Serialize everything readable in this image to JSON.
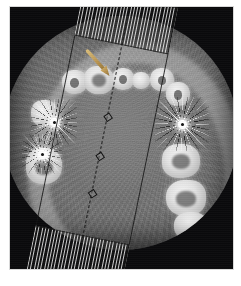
{
  "image": {
    "modality": "CBCT",
    "view": "axial",
    "anatomy": "maxillary dental arch",
    "background_color": "#0a0a0c",
    "field_of_view_shape": "circle"
  },
  "annotation": {
    "arrow": {
      "name": "pointer-arrow",
      "color": "#b89350",
      "direction": "down-right",
      "target": "left maxillary molar"
    }
  },
  "overlay": {
    "name": "cross-section-band",
    "type": "reformat slice band",
    "line_color": "#141414",
    "hatch_color": "#ebebeb",
    "rotation_deg": 11.5,
    "handles": 3
  },
  "features": {
    "metal_artifacts": [
      {
        "label": "metal-restoration-burst",
        "side": "left-posterior"
      },
      {
        "label": "metal-restoration-burst",
        "side": "left-mid"
      },
      {
        "label": "metal-restoration-burst",
        "side": "right-posterior"
      }
    ],
    "teeth_count_visible": 11
  },
  "frame": {
    "border_color": "#d8d8d8",
    "page_background": "#ffffff"
  }
}
